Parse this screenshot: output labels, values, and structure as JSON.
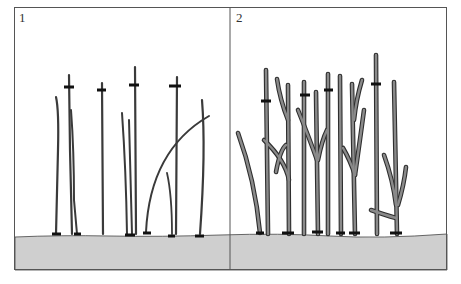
{
  "figure": {
    "panels": [
      {
        "label": "1",
        "description": "Young unbranched stems with cut markers"
      },
      {
        "label": "2",
        "description": "Older branched stems with cut markers"
      }
    ]
  },
  "colors": {
    "background": "#ffffff",
    "frame": "#555555",
    "ground": "#cfcfcf",
    "stem": "#7a7a7a",
    "stem_outline": "#2e2e2e",
    "marker": "#111111"
  }
}
